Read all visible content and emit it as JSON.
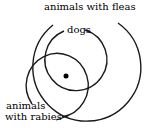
{
  "diagram": {
    "type": "venn",
    "colors": {
      "stroke": "#1a1a1a",
      "background": "#ffffff",
      "text": "#000000"
    },
    "sets": [
      {
        "id": "fleas",
        "label": "animals with fleas",
        "shape": "circle",
        "cx": 86,
        "cy": 67,
        "r": 54
      },
      {
        "id": "dogs",
        "label": "dogs",
        "shape": "circle",
        "cx": 79,
        "cy": 57,
        "r": 31
      },
      {
        "id": "rabies",
        "label_line1": "animals",
        "label_line2": "with rabies",
        "shape": "ellipse",
        "cx": 56,
        "cy": 85,
        "rx": 31,
        "ry": 32
      }
    ],
    "point": {
      "description": "element in dogs, fleas and rabies",
      "x": 66,
      "y": 76,
      "r": 2.5
    }
  }
}
